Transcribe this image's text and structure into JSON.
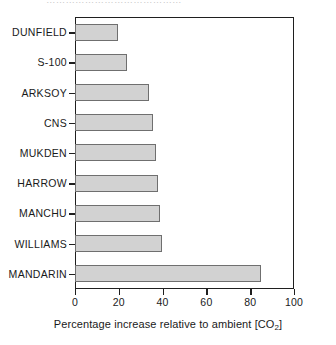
{
  "figure": {
    "top_remnant_text": "……………………………………",
    "background": "#ffffff",
    "bar_fill": "#d2d2d2",
    "bar_stroke": "#6f6f6f",
    "axis_color": "#1f1f1f"
  },
  "axis": {
    "x_title_main": "Percentage increase relative to ambient [CO",
    "x_title_sub": "2",
    "x_title_tail": "]",
    "x_title_full": "Percentage increase relative to ambient [CO2]",
    "x_ticks": [
      "0",
      "20",
      "40",
      "60",
      "80",
      "100"
    ]
  },
  "chart_data": {
    "type": "bar",
    "orientation": "horizontal",
    "title": "",
    "subtitle": "",
    "xlabel": "Percentage increase relative to ambient [CO2]",
    "ylabel": "",
    "xlim": [
      0,
      100
    ],
    "xticks": [
      0,
      20,
      40,
      60,
      80,
      100
    ],
    "grid": false,
    "legend": false,
    "legend_position": "none",
    "categories": [
      "DUNFIELD",
      "S-100",
      "ARKSOY",
      "CNS",
      "MUKDEN",
      "HARROW",
      "MANCHU",
      "WILLIAMS",
      "MANDARIN"
    ],
    "values": [
      20,
      24,
      34,
      36,
      37,
      38,
      39,
      40,
      85
    ],
    "series": [
      {
        "name": "Percentage increase relative to ambient [CO2]",
        "values": [
          20,
          24,
          34,
          36,
          37,
          38,
          39,
          40,
          85
        ]
      }
    ]
  }
}
